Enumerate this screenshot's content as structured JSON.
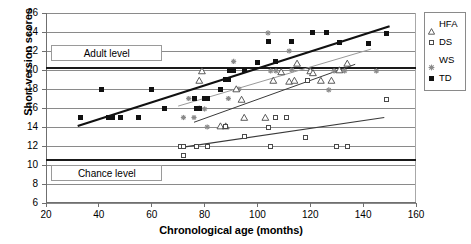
{
  "chart_data": {
    "type": "scatter",
    "title": "",
    "xlabel": "Chronological age (months)",
    "ylabel": "Short version scores",
    "xlim": [
      20,
      160
    ],
    "ylim": [
      6,
      26
    ],
    "xticks": [
      20,
      40,
      60,
      80,
      100,
      120,
      140,
      160
    ],
    "yticks": [
      6,
      8,
      10,
      12,
      14,
      16,
      18,
      20,
      22,
      24,
      26
    ],
    "grid": "horizontal",
    "legend_position": "right",
    "annotations": [
      {
        "text": "Adult level",
        "x": 22,
        "y": 21.8
      },
      {
        "text": "Chance level",
        "x": 22,
        "y": 9.2
      }
    ],
    "reference_lines": [
      {
        "label": "Adult level",
        "y": 20.2
      },
      {
        "label": "Chance level",
        "y": 10.5
      }
    ],
    "legend": [
      {
        "name": "HFA",
        "marker": "open-triangle",
        "color": "#4a4a4a"
      },
      {
        "name": "DS",
        "marker": "open-square",
        "color": "#4a4a4a"
      },
      {
        "name": "WS",
        "marker": "star",
        "color": "#8a8a8a"
      },
      {
        "name": "TD",
        "marker": "filled-square",
        "color": "#111111"
      }
    ],
    "series": [
      {
        "name": "TD",
        "marker": "filled-square",
        "color": "#111111",
        "points": [
          [
            33,
            15.0
          ],
          [
            41,
            18.0
          ],
          [
            43.5,
            15.0
          ],
          [
            45,
            15.0
          ],
          [
            48,
            15.0
          ],
          [
            55,
            15.0
          ],
          [
            60,
            18.0
          ],
          [
            65,
            16.0
          ],
          [
            76,
            17.0
          ],
          [
            77,
            16.0
          ],
          [
            78,
            16.0
          ],
          [
            80,
            17.0
          ],
          [
            81,
            17.0
          ],
          [
            86,
            18.0
          ],
          [
            88,
            19.0
          ],
          [
            89,
            19.0
          ],
          [
            89.5,
            20.0
          ],
          [
            91,
            20.0
          ],
          [
            95,
            20.0
          ],
          [
            100,
            20.8
          ],
          [
            104,
            23.0
          ],
          [
            107,
            20.9
          ],
          [
            113,
            23.0
          ],
          [
            121,
            23.9
          ],
          [
            126,
            23.9
          ],
          [
            131,
            22.9
          ],
          [
            142,
            22.8
          ],
          [
            149,
            23.8
          ]
        ],
        "trendline": {
          "x0": 32,
          "y0": 14.1,
          "x1": 150,
          "y1": 24.6
        }
      },
      {
        "name": "WS",
        "marker": "star",
        "color": "#8a8a8a",
        "points": [
          [
            72,
            15.0
          ],
          [
            74,
            17.0
          ],
          [
            76,
            15.0
          ],
          [
            78,
            16.0
          ],
          [
            80,
            15.9
          ],
          [
            81,
            14.0
          ],
          [
            89,
            17.0
          ],
          [
            93,
            18.0
          ],
          [
            104,
            23.9
          ],
          [
            105,
            19.9
          ],
          [
            107,
            19.9
          ],
          [
            112,
            22.0
          ],
          [
            113,
            20.0
          ],
          [
            120,
            19.9
          ],
          [
            127,
            17.9
          ],
          [
            129,
            19.9
          ],
          [
            133,
            19.9
          ],
          [
            145,
            19.9
          ],
          [
            91,
            20.9
          ]
        ],
        "trendline": {
          "x0": 70,
          "y0": 16.2,
          "x1": 143,
          "y1": 22.2
        }
      },
      {
        "name": "HFA",
        "marker": "open-triangle",
        "color": "#4a4a4a",
        "points": [
          [
            78,
            18.9
          ],
          [
            79,
            19.9
          ],
          [
            86,
            14.1
          ],
          [
            88,
            14.1
          ],
          [
            94,
            16.9
          ],
          [
            95,
            15.0
          ],
          [
            103,
            15.0
          ],
          [
            106,
            18.9
          ],
          [
            109,
            19.8
          ],
          [
            112,
            18.8
          ],
          [
            114,
            18.9
          ],
          [
            115,
            20.7
          ],
          [
            120,
            19.9
          ],
          [
            121,
            19.7
          ],
          [
            124,
            18.9
          ],
          [
            128,
            18.9
          ],
          [
            131,
            20.0
          ],
          [
            134,
            20.7
          ],
          [
            92,
            18.0
          ]
        ],
        "trendline": {
          "x0": 76,
          "y0": 14.5,
          "x1": 137,
          "y1": 20.6
        }
      },
      {
        "name": "DS",
        "marker": "open-square",
        "color": "#4a4a4a",
        "points": [
          [
            71,
            12.0
          ],
          [
            72,
            12.0
          ],
          [
            72,
            11.0
          ],
          [
            77,
            12.0
          ],
          [
            81,
            12.0
          ],
          [
            88,
            14.1
          ],
          [
            95,
            13.0
          ],
          [
            104,
            14.0
          ],
          [
            105,
            12.0
          ],
          [
            107,
            15.0
          ],
          [
            111,
            15.0
          ],
          [
            118,
            12.9
          ],
          [
            119,
            18.9
          ],
          [
            130,
            11.9
          ],
          [
            134,
            11.9
          ],
          [
            149,
            16.9
          ]
        ],
        "trendline": {
          "x0": 70,
          "y0": 11.8,
          "x1": 148,
          "y1": 15.0
        }
      }
    ]
  },
  "axis": {
    "y_title": "Short version scores",
    "x_title": "Chronological age (months)",
    "y_tick_labels": [
      "26",
      "24",
      "22",
      "20",
      "18",
      "16",
      "14",
      "12",
      "10",
      "8",
      "6"
    ],
    "x_tick_labels": [
      "20",
      "40",
      "60",
      "80",
      "100",
      "120",
      "140",
      "160"
    ]
  },
  "annotations": {
    "adult_level": "Adult level",
    "chance_level": "Chance level"
  },
  "legend": {
    "items": [
      {
        "label": "HFA"
      },
      {
        "label": "DS"
      },
      {
        "label": "WS"
      },
      {
        "label": "TD"
      }
    ]
  },
  "colors": {
    "td": "#111111",
    "ds": "#4a4a4a",
    "hfa": "#4a4a4a",
    "ws": "#8a8a8a",
    "grid": "#8a8a8a",
    "reference": "#1a1a1a"
  }
}
